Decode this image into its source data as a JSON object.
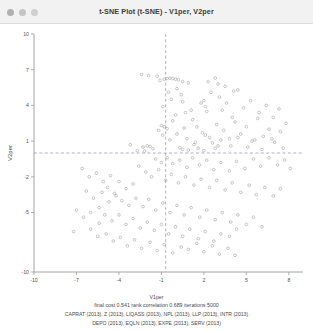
{
  "window": {
    "title": "t-SNE Plot (t-SNE) - V1per, V2per",
    "controls": [
      {
        "name": "close-button",
        "color": "#b0b0b0"
      },
      {
        "name": "minimize-button",
        "color": "#c4c4c4"
      },
      {
        "name": "zoom-button",
        "color": "#cfcfcf"
      }
    ]
  },
  "footer": {
    "stats": "final cost  0.541   rank correlation  0.689   iterations  5000",
    "variables_line1": "CAPRAT (2013), Z (2013), LIQASS (2013), NPL (2013), LLP (2013), INTR (2013)",
    "variables_line2": "DEPO (2013), EQLN (2013), EXPE (2013), SERV (2013)"
  },
  "chart_data": {
    "type": "scatter",
    "title": "t-SNE Plot (t-SNE) - V1per, V2per",
    "xlabel": "V1per",
    "ylabel": "V2per",
    "xlim": [
      -10,
      9
    ],
    "ylim": [
      -10,
      10
    ],
    "xticks": [
      -10,
      -7,
      -4,
      -1,
      2,
      5,
      8
    ],
    "yticks": [
      10,
      7,
      4,
      1,
      -2,
      -5,
      -10
    ],
    "xticklabels": [
      "-10",
      "-7",
      "-4",
      "-1",
      "2",
      "5",
      "8"
    ],
    "yticklabels": [
      "10",
      "7",
      "4",
      "1",
      "-2",
      "-5",
      "-10"
    ],
    "grid": false,
    "legend": false,
    "reference_lines": {
      "vertical_x": -0.7,
      "horizontal_y": 0.0,
      "style": "dashed",
      "color": "#9090b0"
    },
    "marker": {
      "shape": "circle",
      "filled": false,
      "color": "#9a9a9a",
      "size": 1.35
    },
    "final_cost": 0.541,
    "rank_correlation": 0.689,
    "iterations": 5000,
    "points": [
      [
        -1.1,
        6.1
      ],
      [
        -0.8,
        6.2
      ],
      [
        -0.6,
        6.25
      ],
      [
        -0.4,
        6.3
      ],
      [
        -0.2,
        6.25
      ],
      [
        0.0,
        6.2
      ],
      [
        0.2,
        6.15
      ],
      [
        0.5,
        6.0
      ],
      [
        0.9,
        5.9
      ],
      [
        2.3,
        6.0
      ],
      [
        0.1,
        5.4
      ],
      [
        0.4,
        4.9
      ],
      [
        0.5,
        4.3
      ],
      [
        2.0,
        4.4
      ],
      [
        2.1,
        3.9
      ],
      [
        2.2,
        3.5
      ],
      [
        3.1,
        4.7
      ],
      [
        3.3,
        3.6
      ],
      [
        3.5,
        5.6
      ],
      [
        4.0,
        3.0
      ],
      [
        0.0,
        3.2
      ],
      [
        -1.0,
        2.3
      ],
      [
        -0.8,
        2.2
      ],
      [
        -0.6,
        2.05
      ],
      [
        -1.2,
        1.9
      ],
      [
        -3.2,
        0.7
      ],
      [
        -2.3,
        0.5
      ],
      [
        -2.0,
        0.6
      ],
      [
        -1.8,
        0.55
      ],
      [
        -1.6,
        0.35
      ],
      [
        -2.7,
        0.2
      ],
      [
        -2.2,
        0.15
      ],
      [
        0.3,
        0.45
      ],
      [
        0.5,
        0.3
      ],
      [
        0.9,
        0.25
      ],
      [
        1.4,
        0.9
      ],
      [
        1.6,
        0.4
      ],
      [
        2.0,
        0.2
      ],
      [
        2.6,
        0.85
      ],
      [
        3.0,
        0.6
      ],
      [
        -0.5,
        5.1
      ],
      [
        -0.3,
        4.5
      ],
      [
        -0.9,
        3.9
      ],
      [
        0.7,
        3.4
      ],
      [
        1.2,
        2.8
      ],
      [
        1.5,
        2.2
      ],
      [
        1.9,
        1.7
      ],
      [
        2.4,
        1.3
      ],
      [
        2.9,
        2.4
      ],
      [
        3.4,
        1.9
      ],
      [
        3.8,
        1.2
      ],
      [
        4.2,
        2.6
      ],
      [
        4.6,
        1.6
      ],
      [
        5.0,
        2.2
      ],
      [
        5.4,
        1.0
      ],
      [
        5.8,
        2.9
      ],
      [
        6.2,
        1.4
      ],
      [
        6.6,
        2.0
      ],
      [
        7.0,
        0.9
      ],
      [
        7.4,
        1.8
      ],
      [
        -0.2,
        2.7
      ],
      [
        0.6,
        2.1
      ],
      [
        1.1,
        3.6
      ],
      [
        1.8,
        4.2
      ],
      [
        2.5,
        5.1
      ],
      [
        3.0,
        5.8
      ],
      [
        3.6,
        4.2
      ],
      [
        4.1,
        5.2
      ],
      [
        4.8,
        3.8
      ],
      [
        5.3,
        4.4
      ],
      [
        5.9,
        3.4
      ],
      [
        6.4,
        4.0
      ],
      [
        6.9,
        3.0
      ],
      [
        7.3,
        3.7
      ],
      [
        7.8,
        2.5
      ],
      [
        -0.9,
        1.5
      ],
      [
        -0.4,
        1.1
      ],
      [
        0.1,
        1.6
      ],
      [
        0.8,
        1.2
      ],
      [
        1.3,
        0.7
      ],
      [
        2.1,
        1.5
      ],
      [
        2.8,
        0.4
      ],
      [
        3.2,
        1.1
      ],
      [
        3.9,
        0.6
      ],
      [
        4.4,
        1.3
      ],
      [
        5.1,
        0.5
      ],
      [
        5.6,
        1.1
      ],
      [
        6.1,
        0.3
      ],
      [
        6.8,
        1.2
      ],
      [
        7.6,
        0.4
      ],
      [
        -1.4,
        -0.5
      ],
      [
        -1.0,
        -0.8
      ],
      [
        -0.6,
        -0.4
      ],
      [
        -0.2,
        -0.9
      ],
      [
        0.3,
        -0.6
      ],
      [
        0.8,
        -1.2
      ],
      [
        1.2,
        -0.4
      ],
      [
        1.7,
        -1.0
      ],
      [
        2.2,
        -0.6
      ],
      [
        2.7,
        -1.4
      ],
      [
        3.2,
        -0.8
      ],
      [
        3.8,
        -1.5
      ],
      [
        4.3,
        -0.7
      ],
      [
        4.9,
        -1.3
      ],
      [
        5.5,
        -0.5
      ],
      [
        6.0,
        -1.1
      ],
      [
        6.6,
        -0.4
      ],
      [
        7.2,
        -1.0
      ],
      [
        7.7,
        -0.6
      ],
      [
        8.1,
        -1.3
      ],
      [
        -2.6,
        -1.1
      ],
      [
        -2.1,
        -1.6
      ],
      [
        -1.7,
        -2.0
      ],
      [
        -1.2,
        -1.4
      ],
      [
        -0.7,
        -2.3
      ],
      [
        -0.3,
        -1.8
      ],
      [
        0.2,
        -2.5
      ],
      [
        0.7,
        -2.0
      ],
      [
        1.3,
        -2.7
      ],
      [
        1.8,
        -2.2
      ],
      [
        2.4,
        -2.9
      ],
      [
        2.9,
        -2.3
      ],
      [
        3.5,
        -3.1
      ],
      [
        4.0,
        -2.5
      ],
      [
        4.6,
        -3.3
      ],
      [
        5.2,
        -2.7
      ],
      [
        5.7,
        -3.5
      ],
      [
        6.3,
        -2.9
      ],
      [
        6.9,
        -3.6
      ],
      [
        7.4,
        -3.0
      ],
      [
        -4.0,
        -2.4
      ],
      [
        -3.5,
        -3.0
      ],
      [
        -3.0,
        -2.6
      ],
      [
        -4.3,
        -3.4
      ],
      [
        -4.8,
        -2.9
      ],
      [
        -3.8,
        -4.0
      ],
      [
        -3.3,
        -4.4
      ],
      [
        -2.8,
        -3.8
      ],
      [
        -2.3,
        -4.5
      ],
      [
        -1.9,
        -3.9
      ],
      [
        -1.4,
        -4.8
      ],
      [
        -0.9,
        -4.2
      ],
      [
        -0.4,
        -5.0
      ],
      [
        0.1,
        -4.4
      ],
      [
        0.6,
        -5.2
      ],
      [
        1.1,
        -4.6
      ],
      [
        1.7,
        -5.4
      ],
      [
        2.2,
        -4.8
      ],
      [
        2.8,
        -5.6
      ],
      [
        3.3,
        -5.0
      ],
      [
        3.9,
        -5.8
      ],
      [
        4.4,
        -5.2
      ],
      [
        5.0,
        -6.0
      ],
      [
        5.5,
        -5.4
      ],
      [
        6.1,
        -6.2
      ],
      [
        -5.4,
        -4.6
      ],
      [
        -5.0,
        -5.2
      ],
      [
        -4.5,
        -5.7
      ],
      [
        -4.0,
        -5.2
      ],
      [
        -3.5,
        -6.0
      ],
      [
        -3.0,
        -5.5
      ],
      [
        -2.5,
        -6.3
      ],
      [
        -2.0,
        -5.8
      ],
      [
        -1.5,
        -6.5
      ],
      [
        -1.0,
        -6.0
      ],
      [
        -0.5,
        -6.8
      ],
      [
        0.0,
        -6.2
      ],
      [
        0.5,
        -7.0
      ],
      [
        1.0,
        -6.4
      ],
      [
        1.6,
        -7.2
      ],
      [
        2.1,
        -6.6
      ],
      [
        2.7,
        -7.4
      ],
      [
        3.2,
        -6.8
      ],
      [
        3.8,
        -7.0
      ],
      [
        4.3,
        -6.4
      ],
      [
        -6.0,
        -6.4
      ],
      [
        -5.5,
        -7.0
      ],
      [
        -4.9,
        -6.8
      ],
      [
        -4.4,
        -7.4
      ],
      [
        -3.9,
        -7.1
      ],
      [
        -3.4,
        -7.8
      ],
      [
        -2.9,
        -7.3
      ],
      [
        -2.4,
        -8.0
      ],
      [
        -1.8,
        -7.5
      ],
      [
        -1.3,
        -8.2
      ],
      [
        -0.8,
        -7.7
      ],
      [
        -0.2,
        -8.4
      ],
      [
        0.4,
        -7.9
      ],
      [
        0.9,
        -8.1
      ],
      [
        1.5,
        -7.6
      ],
      [
        2.0,
        -8.3
      ],
      [
        2.6,
        -7.8
      ],
      [
        3.1,
        -8.5
      ],
      [
        3.7,
        -8.0
      ],
      [
        4.2,
        -8.6
      ],
      [
        -6.6,
        -1.3
      ],
      [
        -6.1,
        -2.0
      ],
      [
        -5.6,
        -1.7
      ],
      [
        -5.1,
        -2.4
      ],
      [
        -4.6,
        -1.9
      ],
      [
        -6.3,
        -3.2
      ],
      [
        -5.8,
        -3.8
      ],
      [
        -5.2,
        -3.3
      ],
      [
        -4.7,
        -4.1
      ],
      [
        -4.2,
        -3.6
      ],
      [
        -7.0,
        -4.8
      ],
      [
        -6.5,
        -5.4
      ],
      [
        -6.0,
        -5.0
      ],
      [
        -5.4,
        -5.9
      ],
      [
        -7.2,
        -6.6
      ],
      [
        -2.4,
        6.6
      ],
      [
        -1.9,
        6.5
      ],
      [
        -1.3,
        6.45
      ],
      [
        2.8,
        6.3
      ],
      [
        4.4,
        5.3
      ]
    ]
  }
}
